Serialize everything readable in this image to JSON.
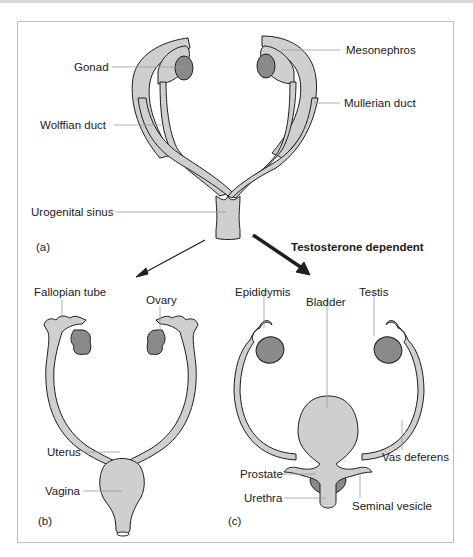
{
  "figure": {
    "panel_a": {
      "tag": "(a)",
      "labels": {
        "gonad": "Gonad",
        "mesonephros": "Mesonephros",
        "mullerian_duct": "Mullerian duct",
        "wolffian_duct": "Wolffian duct",
        "urogenital_sinus": "Urogenital sinus"
      }
    },
    "arrows": {
      "female_label": "",
      "male_label": "Testosterone dependent"
    },
    "panel_b": {
      "tag": "(b)",
      "labels": {
        "fallopian_tube": "Fallopian tube",
        "ovary": "Ovary",
        "uterus": "Uterus",
        "vagina": "Vagina"
      }
    },
    "panel_c": {
      "tag": "(c)",
      "labels": {
        "epididymis": "Epididymis",
        "bladder": "Bladder",
        "testis": "Testis",
        "vas_deferens": "Vas deferens",
        "prostate": "Prostate",
        "urethra": "Urethra",
        "seminal_vesicle": "Seminal vesicle"
      }
    },
    "colors": {
      "tissue_light": "#cfcfcf",
      "tissue_dark": "#8a8a8a",
      "outline": "#1f1f1f",
      "leader": "#9a9a9a"
    }
  }
}
